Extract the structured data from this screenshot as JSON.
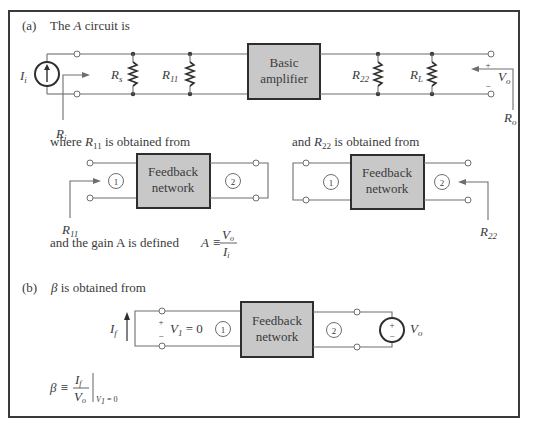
{
  "part_a": {
    "label": "(a)",
    "intro": "The",
    "intro_var": "A",
    "intro_rest": "circuit is",
    "source_label": "I",
    "source_sub": "i",
    "ri_label": "R",
    "ri_sub": "i",
    "rs_label": "R",
    "rs_sub": "s",
    "r11_label": "R",
    "r11_sub": "11",
    "amp_line1": "Basic",
    "amp_line2": "amplifier",
    "r22_label": "R",
    "r22_sub": "22",
    "rl_label": "R",
    "rl_sub": "L",
    "vo_plus": "+",
    "vo_minus": "−",
    "vo_label": "V",
    "vo_sub": "o",
    "ro_label": "R",
    "ro_sub": "o",
    "r11_text_pre": "where",
    "r11_text_var": "R",
    "r11_text_sub": "11",
    "r11_text_post": "is obtained from",
    "r22_text_pre": "and",
    "r22_text_var": "R",
    "r22_text_sub": "22",
    "r22_text_post": "is obtained from",
    "fb_line1": "Feedback",
    "fb_line2": "network",
    "port1": "1",
    "port2": "2",
    "r11_arrow_label": "R",
    "r11_arrow_sub": "11",
    "r22_arrow_label": "R",
    "r22_arrow_sub": "22",
    "gain_text": "and the gain A is defined",
    "gain_lhs": "A ≡",
    "gain_num": "V",
    "gain_num_sub": "o",
    "gain_den": "I",
    "gain_den_sub": "i"
  },
  "part_b": {
    "label": "(b)",
    "beta": "β",
    "intro_rest": "is obtained from",
    "if_label": "I",
    "if_sub": "f",
    "v1_plus": "+",
    "v1_minus": "−",
    "v1_eq": "V",
    "v1_sub": "1",
    "v1_val": "= 0",
    "port1": "1",
    "port2": "2",
    "fb_line1": "Feedback",
    "fb_line2": "network",
    "src_plus": "+",
    "src_minus": "−",
    "vo_label": "V",
    "vo_sub": "o",
    "beta_def_lhs": "β ≡",
    "beta_num": "I",
    "beta_num_sub": "f",
    "beta_den": "V",
    "beta_den_sub": "o",
    "cond_var": "V",
    "cond_sub": "1",
    "cond_val": "= 0"
  },
  "colors": {
    "box_fill": "#c8c8c8",
    "border": "#3a3a3a",
    "wire": "#6e6e6e"
  }
}
